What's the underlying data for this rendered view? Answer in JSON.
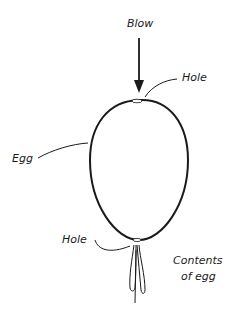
{
  "diagram": {
    "labels": {
      "blow": "Blow",
      "hole_top": "Hole",
      "egg": "Egg",
      "hole_bottom": "Hole",
      "contents_line1": "Contents",
      "contents_line2": "of egg"
    },
    "colors": {
      "ink": "#1a1a1a",
      "background": "#ffffff"
    }
  }
}
